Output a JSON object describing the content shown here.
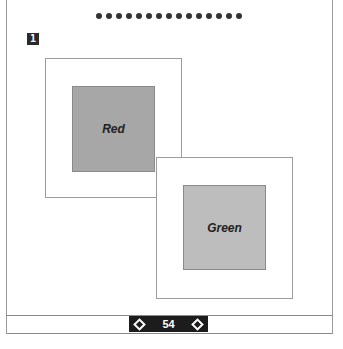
{
  "header": {
    "dot_count": 15
  },
  "step": {
    "number": "1"
  },
  "boxes": [
    {
      "label": "Red",
      "fill": "#a7a7a7"
    },
    {
      "label": "Green",
      "fill": "#bdbdbd"
    }
  ],
  "footer": {
    "page_number": "54",
    "prev_icon": "diamond-left-icon",
    "next_icon": "diamond-right-icon"
  }
}
